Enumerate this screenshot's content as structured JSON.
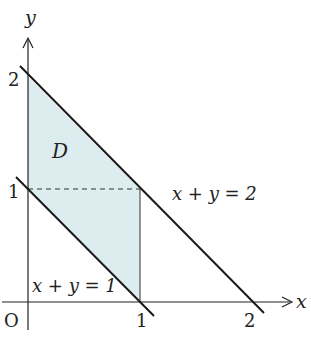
{
  "diagram": {
    "axes": {
      "x_label": "x",
      "y_label": "y",
      "origin_label": "O"
    },
    "ticks": {
      "x": [
        "1",
        "2"
      ],
      "y": [
        "1",
        "2"
      ]
    },
    "region_label": "D",
    "lines": [
      {
        "label": "x + y = 1",
        "equation": "x+y=1"
      },
      {
        "label": "x + y = 2",
        "equation": "x+y=2"
      }
    ],
    "colors": {
      "fill": "#dcecef",
      "stroke": "#1a1a1a"
    }
  }
}
